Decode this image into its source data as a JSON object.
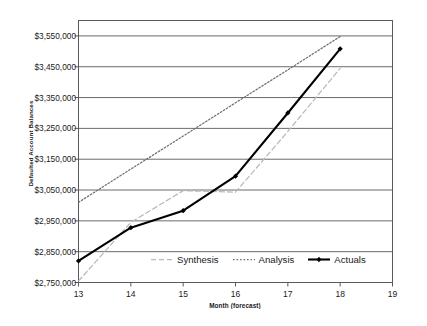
{
  "chart_data": {
    "type": "line",
    "title": "",
    "xlabel": "Month (forecast)",
    "ylabel": "Defaulted Account Balances",
    "x": [
      13,
      14,
      15,
      16,
      17,
      18
    ],
    "xlim": [
      13,
      19
    ],
    "ylim": [
      2750000,
      3600000
    ],
    "xticks": [
      13,
      14,
      15,
      16,
      17,
      18,
      19
    ],
    "xtick_labels": [
      "13",
      "14",
      "15",
      "16",
      "17",
      "18",
      "19"
    ],
    "yticks": [
      2750000,
      2850000,
      2950000,
      3050000,
      3150000,
      3250000,
      3350000,
      3450000,
      3550000
    ],
    "ytick_labels": [
      "$2,750,000",
      "$2,850,000",
      "$2,950,000",
      "$3,050,000",
      "$3,150,000",
      "$3,250,000",
      "$3,350,000",
      "$3,450,000",
      "$3,550,000"
    ],
    "grid": "horizontal",
    "legend_position": "inside bottom-center",
    "series": [
      {
        "name": "Synthesis",
        "style": "dashed",
        "color": "#b9b9b9",
        "marker": "none",
        "values": [
          2755000,
          2945000,
          3048000,
          3043000,
          3240000,
          3445000
        ]
      },
      {
        "name": "Analysis",
        "style": "dotted",
        "color": "#6e6e6e",
        "marker": "none",
        "values": [
          3010000,
          3118000,
          3225000,
          3333000,
          3440000,
          3548000
        ]
      },
      {
        "name": "Actuals",
        "style": "solid",
        "color": "#000000",
        "marker": "diamond",
        "values": [
          2820000,
          2928000,
          2983000,
          3095000,
          3300000,
          3508000
        ]
      }
    ]
  },
  "legend": {
    "items": [
      {
        "label": "Synthesis"
      },
      {
        "label": "Analysis"
      },
      {
        "label": "Actuals"
      }
    ]
  },
  "axes": {
    "y_title": "Defaulted Account Balances",
    "x_title": "Month (forecast)"
  },
  "colors": {
    "axis": "#5a5a5a",
    "grid": "#6b6b6b",
    "synthesis": "#b9b9b9",
    "analysis": "#6e6e6e",
    "actuals": "#000000",
    "background": "#ffffff"
  }
}
